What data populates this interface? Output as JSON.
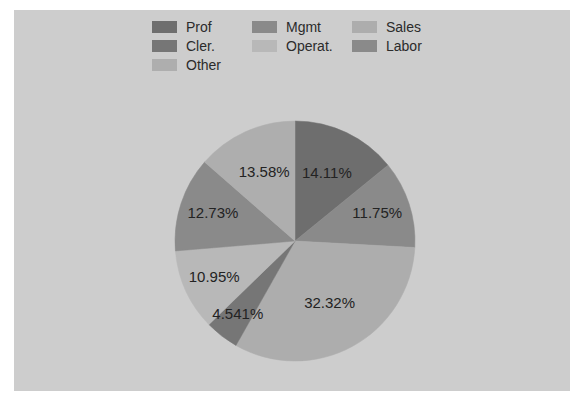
{
  "figure": {
    "background_color": "#ffffff",
    "plot_background_color": "#cdcdcd"
  },
  "legend": {
    "rows": [
      [
        {
          "label": "Prof",
          "color": "#6e6e6e"
        },
        {
          "label": "Mgmt",
          "color": "#8a8a8a"
        },
        {
          "label": "Sales",
          "color": "#adadad"
        }
      ],
      [
        {
          "label": "Cler.",
          "color": "#767676"
        },
        {
          "label": "Operat.",
          "color": "#b8b8b8"
        },
        {
          "label": "Labor",
          "color": "#8a8a8a"
        }
      ],
      [
        {
          "label": "Other",
          "color": "#aeaeae"
        }
      ]
    ]
  },
  "chart_data": {
    "type": "pie",
    "title": "",
    "legend_position": "top",
    "start_angle": 90,
    "direction": "clockwise",
    "center": {
      "x": 295,
      "y": 241
    },
    "radius": 120,
    "labels": [
      "Prof",
      "Mgmt",
      "Sales",
      "Cler.",
      "Operat.",
      "Labor",
      "Other"
    ],
    "values": [
      14.11,
      11.75,
      32.32,
      4.541,
      10.95,
      12.73,
      13.58
    ],
    "display_labels": [
      "14.11%",
      "11.75%",
      "32.32%",
      "4.541%",
      "10.95%",
      "12.73%",
      "13.58%"
    ],
    "colors": [
      "#6e6e6e",
      "#8a8a8a",
      "#adadad",
      "#767676",
      "#b8b8b8",
      "#8a8a8a",
      "#aeaeae"
    ],
    "label_radius_factor": [
      0.62,
      0.72,
      0.6,
      0.78,
      0.74,
      0.72,
      0.62
    ]
  }
}
